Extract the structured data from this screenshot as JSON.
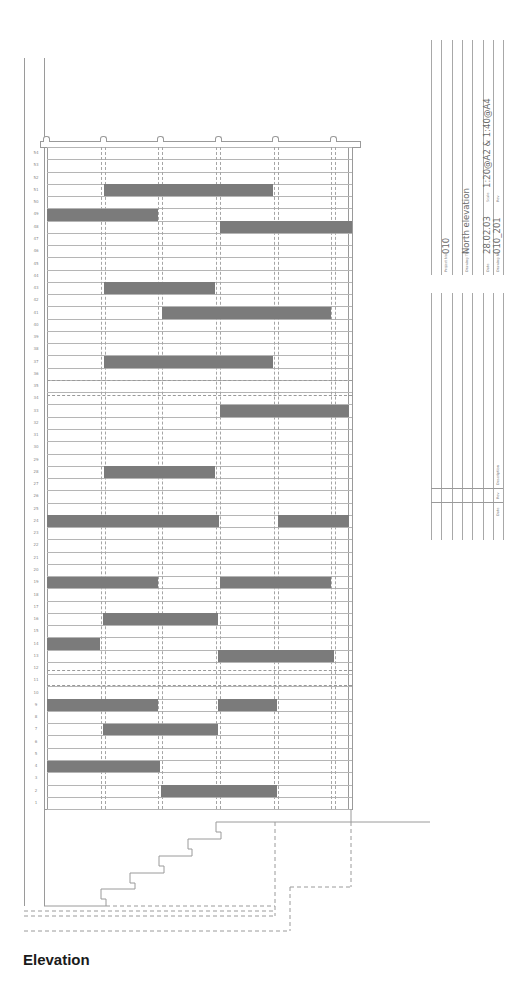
{
  "drawing": {
    "caption": "Elevation",
    "floors": [
      54,
      53,
      52,
      51,
      50,
      49,
      48,
      47,
      46,
      45,
      44,
      43,
      42,
      41,
      40,
      39,
      38,
      37,
      36,
      35,
      34,
      33,
      32,
      31,
      30,
      29,
      28,
      27,
      26,
      25,
      24,
      23,
      22,
      21,
      20,
      19,
      18,
      17,
      16,
      15,
      14,
      13,
      12,
      11,
      10,
      9,
      8,
      7,
      6,
      5,
      4,
      3,
      2,
      1
    ],
    "floor_count": 54,
    "panels": [
      {
        "floor": 51,
        "x1": 104,
        "x2": 273
      },
      {
        "floor": 49,
        "x1": 47,
        "x2": 158
      },
      {
        "floor": 48,
        "x1": 220,
        "x2": 352
      },
      {
        "floor": 43,
        "x1": 104,
        "x2": 215
      },
      {
        "floor": 41,
        "x1": 162,
        "x2": 331
      },
      {
        "floor": 37,
        "x1": 104,
        "x2": 273
      },
      {
        "floor": 33,
        "x1": 220,
        "x2": 349
      },
      {
        "floor": 28,
        "x1": 104,
        "x2": 215
      },
      {
        "floor": 24,
        "x1": 47,
        "x2": 219
      },
      {
        "floor": 24,
        "x1": 278,
        "x2": 349
      },
      {
        "floor": 19,
        "x1": 47,
        "x2": 158
      },
      {
        "floor": 19,
        "x1": 220,
        "x2": 331
      },
      {
        "floor": 16,
        "x1": 103,
        "x2": 218
      },
      {
        "floor": 14,
        "x1": 47,
        "x2": 100
      },
      {
        "floor": 13,
        "x1": 218,
        "x2": 334
      },
      {
        "floor": 9,
        "x1": 47,
        "x2": 158
      },
      {
        "floor": 9,
        "x1": 218,
        "x2": 277
      },
      {
        "floor": 7,
        "x1": 103,
        "x2": 218
      },
      {
        "floor": 4,
        "x1": 47,
        "x2": 160
      },
      {
        "floor": 2,
        "x1": 161,
        "x2": 277
      }
    ],
    "panel_color": "#7b7b7b",
    "line_color": "#9a9a9a"
  },
  "title_block": {
    "project_no_label": "Project No",
    "project_no": "010",
    "drawing_title_label": "Drawing Title",
    "drawing_title": "North elevation",
    "date_label": "Date",
    "date": "28.02.03",
    "scale_label": "Scale",
    "scale": "1:20@A2 & 1:40@A4",
    "drawing_no_label": "Drawing No",
    "drawing_no": "010_201",
    "rev_label": "Rev",
    "revisions_table": {
      "date_label": "Date",
      "rev_label": "Rev",
      "description_label": "Description"
    }
  }
}
